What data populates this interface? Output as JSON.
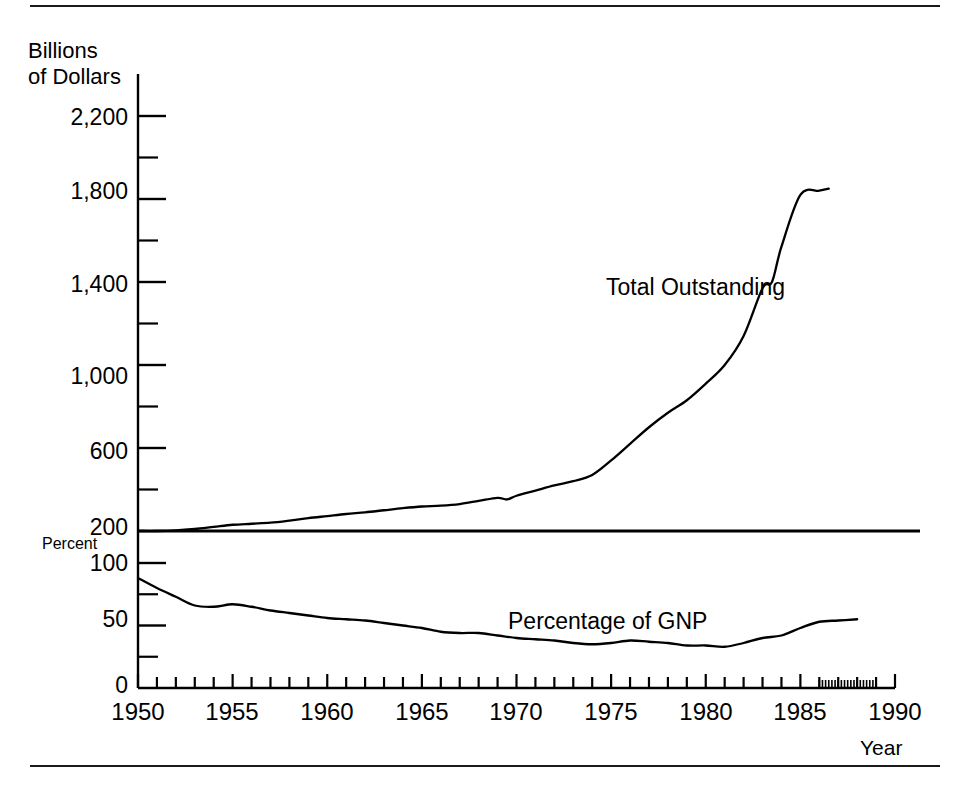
{
  "figure": {
    "top_rule": "divider",
    "bottom_rule": "divider",
    "y_axis_unit_top": "Billions\nof Dollars",
    "y_axis_unit_bottom": "Percent",
    "x_axis_title": "Year"
  },
  "chart_data": {
    "type": "line",
    "title": "",
    "subtitle": "",
    "xlabel": "Year",
    "ylabel": "Billions of Dollars",
    "grid": false,
    "legend_position": "inline-annotation",
    "panels": [
      {
        "name": "total-outstanding-panel",
        "ylabel": "Billions of Dollars",
        "ylim": [
          200,
          2200
        ],
        "yticks": [
          200,
          600,
          1000,
          1400,
          1800,
          2200
        ],
        "ytick_labels": [
          "200",
          "600",
          "1,000",
          "1,400",
          "1,800",
          "2,200"
        ],
        "yminor_ticks": [
          400,
          800,
          1200,
          1600,
          2000
        ],
        "xlim": [
          1950,
          1990
        ],
        "series": [
          {
            "name": "Total Outstanding",
            "annotation": "Total Outstanding",
            "x": [
              1950,
              1951,
              1952,
              1953,
              1954,
              1955,
              1956,
              1957,
              1958,
              1959,
              1960,
              1961,
              1962,
              1963,
              1964,
              1965,
              1966,
              1967,
              1968,
              1969,
              1969.5,
              1970,
              1971,
              1972,
              1973,
              1974,
              1975,
              1976,
              1977,
              1978,
              1979,
              1980,
              1981,
              1982,
              1983,
              1983.5,
              1984,
              1985,
              1986,
              1986.5
            ],
            "values": [
              200,
              200,
              203,
              210,
              220,
              230,
              235,
              240,
              250,
              262,
              272,
              282,
              290,
              300,
              310,
              318,
              322,
              330,
              345,
              360,
              352,
              370,
              395,
              420,
              440,
              470,
              540,
              620,
              700,
              770,
              830,
              910,
              1000,
              1140,
              1370,
              1400,
              1570,
              1820,
              1840,
              1850
            ]
          }
        ]
      },
      {
        "name": "percentage-of-gnp-panel",
        "ylabel": "Percent",
        "ylim": [
          0,
          100
        ],
        "yticks": [
          0,
          50,
          100
        ],
        "ytick_labels": [
          "0",
          "50",
          "100"
        ],
        "yminor_ticks": [
          25,
          75
        ],
        "xlim": [
          1950,
          1990
        ],
        "series": [
          {
            "name": "Percentage of GNP",
            "annotation": "Percentage of GNP",
            "x": [
              1950,
              1951,
              1952,
              1953,
              1954,
              1955,
              1956,
              1957,
              1958,
              1959,
              1960,
              1961,
              1962,
              1963,
              1964,
              1965,
              1966,
              1967,
              1968,
              1969,
              1970,
              1971,
              1972,
              1973,
              1974,
              1975,
              1976,
              1977,
              1978,
              1979,
              1980,
              1981,
              1982,
              1983,
              1984,
              1985,
              1986,
              1987,
              1988
            ],
            "values": [
              88,
              80,
              73,
              66,
              65,
              67,
              65,
              62,
              60,
              58,
              56,
              55,
              54,
              52,
              50,
              48,
              45,
              44,
              44,
              42,
              40,
              39,
              38,
              36,
              35,
              36,
              38,
              37,
              36,
              34,
              34,
              33,
              36,
              40,
              42,
              48,
              53,
              54,
              55
            ]
          }
        ]
      }
    ],
    "xticks": [
      1950,
      1955,
      1960,
      1965,
      1970,
      1975,
      1980,
      1985,
      1990
    ],
    "xtick_labels": [
      "1950",
      "1955",
      "1960",
      "1965",
      "1970",
      "1975",
      "1980",
      "1985",
      "1990"
    ],
    "xminor_tick_interval": 1,
    "x_dense_tick_range": [
      1986,
      1989
    ],
    "annotations": [
      {
        "text": "Total Outstanding",
        "panel": "total-outstanding-panel"
      },
      {
        "text": "Percentage of GNP",
        "panel": "percentage-of-gnp-panel"
      }
    ],
    "colors": {
      "line": "#000000",
      "axis": "#000000",
      "background": "#ffffff"
    }
  }
}
